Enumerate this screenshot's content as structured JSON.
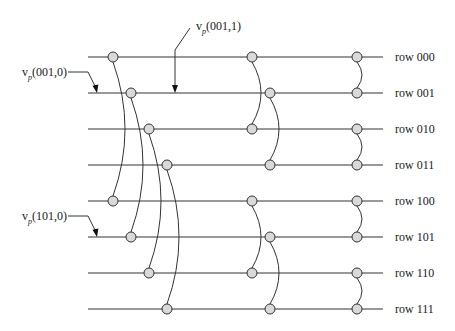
{
  "diagram": {
    "rows": [
      {
        "label": "row 000",
        "y": 57
      },
      {
        "label": "row 001",
        "y": 93
      },
      {
        "label": "row 010",
        "y": 129
      },
      {
        "label": "row 011",
        "y": 165
      },
      {
        "label": "row 100",
        "y": 201
      },
      {
        "label": "row 101",
        "y": 237
      },
      {
        "label": "row 110",
        "y": 273
      },
      {
        "label": "row 111",
        "y": 309
      }
    ],
    "line_x_start": 88,
    "line_x_end": 383,
    "label_x": 395,
    "node_radius": 5,
    "node_fill": "#d9d9d9",
    "stroke_color": "#333333",
    "connections": [
      {
        "from": 0,
        "to": 4,
        "x_from": 113,
        "x_to": 113,
        "bulge": 12
      },
      {
        "from": 1,
        "to": 5,
        "x_from": 131,
        "x_to": 131,
        "bulge": 12
      },
      {
        "from": 2,
        "to": 6,
        "x_from": 149,
        "x_to": 149,
        "bulge": 12
      },
      {
        "from": 3,
        "to": 7,
        "x_from": 167,
        "x_to": 167,
        "bulge": 12
      },
      {
        "from": 0,
        "to": 2,
        "x_from": 252,
        "x_to": 252,
        "bulge": 9
      },
      {
        "from": 1,
        "to": 3,
        "x_from": 270,
        "x_to": 270,
        "bulge": 9
      },
      {
        "from": 4,
        "to": 6,
        "x_from": 252,
        "x_to": 252,
        "bulge": 9
      },
      {
        "from": 5,
        "to": 7,
        "x_from": 270,
        "x_to": 270,
        "bulge": 9
      },
      {
        "from": 0,
        "to": 1,
        "x_from": 357,
        "x_to": 357,
        "bulge": 5
      },
      {
        "from": 2,
        "to": 3,
        "x_from": 357,
        "x_to": 357,
        "bulge": 5
      },
      {
        "from": 4,
        "to": 5,
        "x_from": 357,
        "x_to": 357,
        "bulge": 5
      },
      {
        "from": 6,
        "to": 7,
        "x_from": 357,
        "x_to": 357,
        "bulge": 5
      }
    ],
    "annotations": [
      {
        "main": "v",
        "sub": "p",
        "args": "(001,0)",
        "text_x": 22,
        "text_y": 76,
        "leader": [
          [
            68,
            72
          ],
          [
            88,
            72
          ],
          [
            96,
            88
          ]
        ],
        "arrow_tip": [
          97,
          93
        ]
      },
      {
        "main": "v",
        "sub": "p",
        "args": "(001,1)",
        "text_x": 196,
        "text_y": 30,
        "leader": [
          [
            190,
            28
          ],
          [
            175,
            50
          ],
          [
            175,
            86
          ]
        ],
        "arrow_tip": [
          175,
          93
        ]
      },
      {
        "main": "v",
        "sub": "p",
        "args": "(101,0)",
        "text_x": 22,
        "text_y": 220,
        "leader": [
          [
            68,
            216
          ],
          [
            88,
            216
          ],
          [
            96,
            232
          ]
        ],
        "arrow_tip": [
          97,
          237
        ]
      }
    ]
  }
}
